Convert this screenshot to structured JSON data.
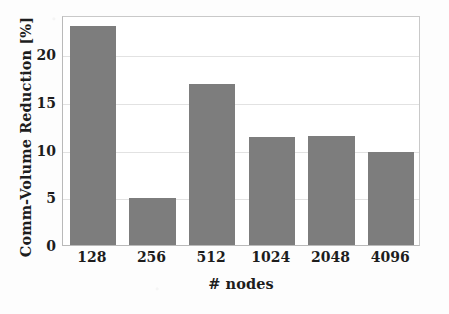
{
  "chart_data": {
    "type": "bar",
    "title": "",
    "xlabel": "# nodes",
    "ylabel": "Comm-Volume Reduction [%]",
    "categories": [
      "128",
      "256",
      "512",
      "1024",
      "2048",
      "4096"
    ],
    "values": [
      23.0,
      4.9,
      16.9,
      11.3,
      11.4,
      9.8
    ],
    "series": [
      {
        "name": "Comm-Volume Reduction",
        "values": [
          23.0,
          4.9,
          16.9,
          11.3,
          11.4,
          9.8
        ]
      }
    ],
    "ylim": [
      0,
      24.1
    ],
    "xlim_categories": 6,
    "yticks": [
      0,
      5,
      10,
      15,
      20
    ],
    "ytick_labels": [
      "0",
      "5",
      "10",
      "15",
      "20"
    ],
    "grid": "horizontal",
    "legend": "none",
    "bar_color": "#7d7d7d",
    "grid_color": "#e2e2e2",
    "frame_color": "#b9b9b9",
    "text_color": "#1d1d1d",
    "background_color": "#ffffff"
  }
}
